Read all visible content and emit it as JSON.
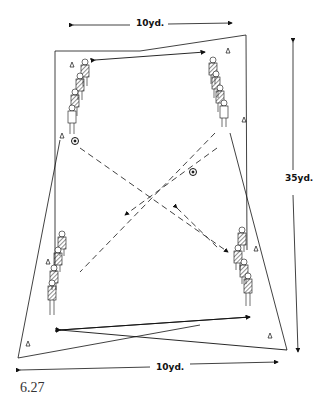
{
  "diagram": {
    "caption": "6.27",
    "labels": {
      "top_width": "10yd.",
      "bottom_width": "10yd.",
      "height": "35yd."
    },
    "elements": {
      "player_groups": [
        {
          "position": "top-left",
          "count": 4
        },
        {
          "position": "top-right",
          "count": 4
        },
        {
          "position": "bottom-left",
          "count": 4
        },
        {
          "position": "bottom-right",
          "count": 4
        }
      ],
      "balls": [
        {
          "position": "top-left"
        },
        {
          "position": "center-right"
        }
      ],
      "cones": 8,
      "pass_lines": "dashed diagonal passes crossing in center",
      "run_lines": "solid arrows between player groups"
    },
    "colors": {
      "ink": "#111111",
      "background": "#ffffff"
    }
  }
}
